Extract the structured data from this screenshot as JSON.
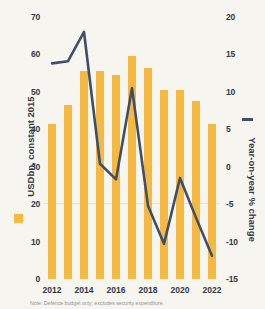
{
  "chart_data": {
    "type": "bar",
    "title": "",
    "subtitle": "",
    "categories": [
      "2012",
      "2013",
      "2014",
      "2015",
      "2016",
      "2017",
      "2018",
      "2019",
      "2020",
      "2021",
      "2022"
    ],
    "xlabel": "",
    "grid": false,
    "legend_position": "left-axis-and-right-axis",
    "series": [
      {
        "name": "USDbn, constant 2015",
        "type": "bar",
        "axis": "left",
        "color": "#f5b942",
        "values": [
          41.5,
          46.5,
          55.5,
          55.5,
          54.5,
          59.5,
          56.5,
          50.5,
          50.5,
          47.5,
          41.5
        ]
      },
      {
        "name": "Year-on-year % change",
        "type": "line",
        "axis": "right",
        "color": "#3f4f6b",
        "values": [
          13.8,
          14.1,
          18.0,
          0.4,
          -1.7,
          10.5,
          -5.2,
          -10.3,
          -1.5,
          -6.8,
          -11.9
        ]
      }
    ],
    "left_axis": {
      "label": "USDbn, constant 2015",
      "ticks": [
        0,
        10,
        20,
        30,
        40,
        50,
        60,
        70
      ],
      "tick_labels": [
        "0",
        "10",
        "20",
        "30",
        "40",
        "50",
        "60",
        "70"
      ],
      "ylim": [
        0,
        70
      ]
    },
    "right_axis": {
      "label": "Year-on-year % change",
      "ticks": [
        -15,
        -10,
        -5,
        0,
        5,
        10,
        15,
        20
      ],
      "tick_labels": [
        "-15",
        "-10",
        "-5",
        "0",
        "5",
        "10",
        "15",
        "20"
      ],
      "ylim": [
        -15,
        20
      ]
    },
    "x_tick_labels": [
      "2012",
      "2014",
      "2016",
      "2018",
      "2020",
      "2022"
    ]
  },
  "footnote": {
    "text": "Note: Defence budget only; excludes security expenditure."
  },
  "colors": {
    "bar": "#f5b942",
    "line": "#3f4f6b",
    "background": "#f7f5f0",
    "text": "#2f3a46"
  }
}
